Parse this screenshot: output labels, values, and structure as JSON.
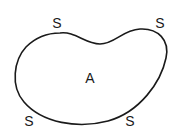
{
  "diagram": {
    "type": "region-with-boundary-points",
    "shape": "bean",
    "stroke_color": "#1a1a1a",
    "region_label": {
      "text": "A",
      "x": 90,
      "y": 78
    },
    "boundary_labels": [
      {
        "text": "S",
        "x": 57,
        "y": 23
      },
      {
        "text": "S",
        "x": 160,
        "y": 23
      },
      {
        "text": "S",
        "x": 29,
        "y": 121
      },
      {
        "text": "S",
        "x": 130,
        "y": 121
      }
    ]
  }
}
